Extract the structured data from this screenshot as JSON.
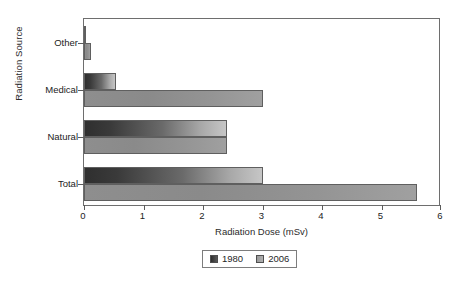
{
  "chart_data": {
    "type": "bar",
    "orientation": "horizontal",
    "title": "",
    "xlabel": "Radiation Dose (mSv)",
    "ylabel": "Radiation Source",
    "categories": [
      "Other",
      "Medical",
      "Natural",
      "Total"
    ],
    "series": [
      {
        "name": "1980",
        "values": [
          0.03,
          0.53,
          2.4,
          3.0
        ],
        "color": "#3a3a3a"
      },
      {
        "name": "2006",
        "values": [
          0.12,
          3.0,
          2.4,
          5.6
        ],
        "color": "#929292"
      }
    ],
    "xlim": [
      0,
      6
    ],
    "xticks": [
      0,
      1,
      2,
      3,
      4,
      5,
      6
    ],
    "xticklabels": [
      "0",
      "1",
      "2",
      "3",
      "4",
      "5",
      "6"
    ],
    "grid": false,
    "legend": {
      "position": "below-center",
      "entries": [
        "1980",
        "2006"
      ]
    }
  },
  "legend": {
    "entries": [
      {
        "label": "1980",
        "swatch": "legend-swatch-1980"
      },
      {
        "label": "2006",
        "swatch": "legend-swatch-2006"
      }
    ]
  },
  "caption": {
    "text": ""
  }
}
